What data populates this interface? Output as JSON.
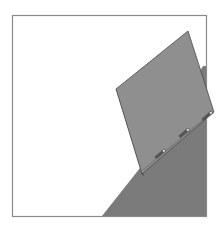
{
  "figure": {
    "type": "geometric illustration",
    "frame": {
      "x": 12,
      "y": 15,
      "width": 194,
      "height": 202,
      "stroke": "#8a8a8a"
    },
    "background_shape": {
      "points": [
        [
          102,
          216
        ],
        [
          140,
          168
        ],
        [
          203,
          66
        ],
        [
          207,
          216
        ]
      ],
      "fill": "#7d7d7d"
    },
    "panel": {
      "points": [
        [
          188,
          31
        ],
        [
          214,
          112
        ],
        [
          142,
          174
        ],
        [
          116,
          89
        ]
      ],
      "fill": "#8e8e8e",
      "stroke": "#4a4a4a"
    },
    "hinges": {
      "count": 3,
      "positions": [
        [
          161,
          153
        ],
        [
          185,
          131
        ],
        [
          209,
          114
        ]
      ],
      "color": "#3a3a3a"
    },
    "colors": {
      "background": "#ffffff",
      "frame": "#8a8a8a",
      "dark_shape": "#7d7d7d",
      "panel": "#8e8e8e"
    }
  }
}
